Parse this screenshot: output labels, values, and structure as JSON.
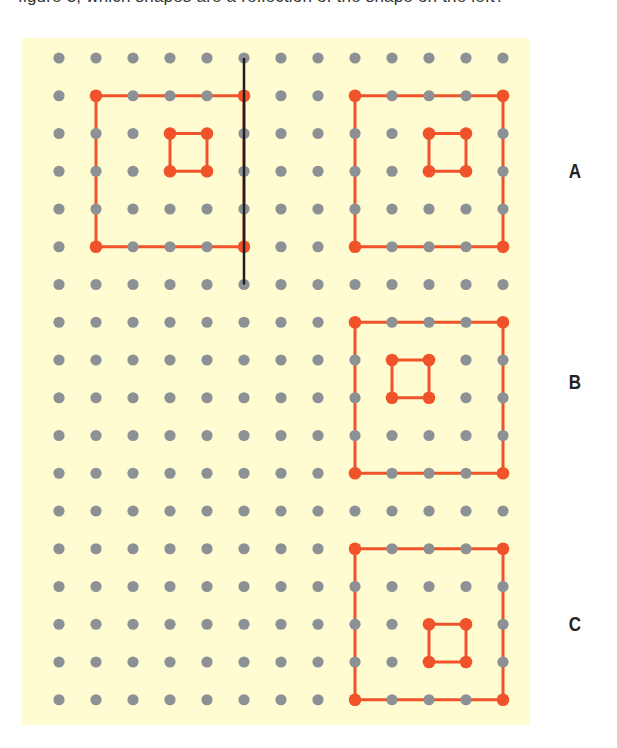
{
  "top_text": "figure 3, which shapes are a reflection of the shape on the left?",
  "colors": {
    "background_panel": "#fffcd2",
    "peg": "#8c9196",
    "band": "#f0532a",
    "mirror_line": "#1e1e1e",
    "label": "#222222"
  },
  "grid": {
    "columns": 13,
    "rows": 18,
    "origin_x": 59,
    "origin_y": 58,
    "spacing_x": 37,
    "spacing_y": 37.75
  },
  "mirror_line": {
    "col": 5,
    "row_start": 0,
    "row_end": 6
  },
  "shapes": [
    {
      "id": "original",
      "label": "",
      "outer": {
        "col_start": 1,
        "col_end": 5,
        "row_start": 1,
        "row_end": 5
      },
      "inner": {
        "col_start": 3,
        "col_end": 4,
        "row_start": 2,
        "row_end": 3
      }
    },
    {
      "id": "A",
      "label": "A",
      "label_x": 575,
      "label_y": 171,
      "outer": {
        "col_start": 8,
        "col_end": 12,
        "row_start": 1,
        "row_end": 5
      },
      "inner": {
        "col_start": 10,
        "col_end": 11,
        "row_start": 2,
        "row_end": 3
      }
    },
    {
      "id": "B",
      "label": "B",
      "label_x": 575,
      "label_y": 382,
      "outer": {
        "col_start": 8,
        "col_end": 12,
        "row_start": 7,
        "row_end": 11
      },
      "inner": {
        "col_start": 9,
        "col_end": 10,
        "row_start": 8,
        "row_end": 9
      }
    },
    {
      "id": "C",
      "label": "C",
      "label_x": 575,
      "label_y": 624,
      "outer": {
        "col_start": 8,
        "col_end": 12,
        "row_start": 13,
        "row_end": 17
      },
      "inner": {
        "col_start": 10,
        "col_end": 11,
        "row_start": 15,
        "row_end": 16
      }
    }
  ],
  "labels": {
    "a": "A",
    "b": "B",
    "c": "C"
  }
}
